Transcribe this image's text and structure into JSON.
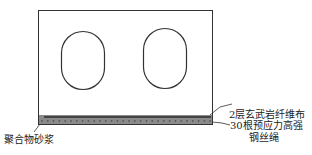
{
  "diagram": {
    "type": "cross-section of hollow slab strengthened at bottom",
    "labels": {
      "basalt_fiber": "2层玄武岩纤维布",
      "steel_wire_line1": "30根预应力高强",
      "steel_wire_line2": "钢丝绳",
      "mortar": "聚合物砂浆"
    },
    "colors": {
      "outline": "#333333",
      "fiber_band": "#555555",
      "mortar_band": "#8a8a8a",
      "wire_dots": "#5a5a5a"
    },
    "wire_count": 30
  }
}
